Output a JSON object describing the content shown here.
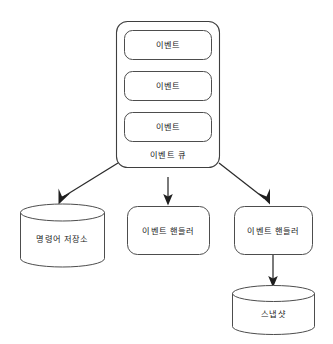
{
  "diagram": {
    "background_color": "#ffffff",
    "stroke_color": "#4d4d4d",
    "arrow_color": "#1f1f1f",
    "text_color": "#1a1a1a",
    "nodes": {
      "event_queue": {
        "label": "이벤트 큐",
        "shape": "rounded-rect",
        "items": [
          {
            "label": "이벤트",
            "shape": "rounded-rect"
          },
          {
            "label": "이벤트",
            "shape": "rounded-rect"
          },
          {
            "label": "이벤트",
            "shape": "rounded-rect"
          }
        ]
      },
      "command_store": {
        "label": "명령어 저장소",
        "shape": "cylinder"
      },
      "event_handler_center": {
        "label": "이벤트 핸들러",
        "shape": "rounded-rect"
      },
      "event_handler_right": {
        "label": "이벤트 핸들러",
        "shape": "rounded-rect"
      },
      "snapshot": {
        "label": "스냅샷",
        "shape": "cylinder"
      }
    },
    "edges": [
      {
        "from": "event_queue",
        "to": "command_store",
        "style": "solid-arrow"
      },
      {
        "from": "event_queue",
        "to": "event_handler_center",
        "style": "solid-arrow"
      },
      {
        "from": "event_queue",
        "to": "event_handler_right",
        "style": "solid-arrow"
      },
      {
        "from": "event_handler_right",
        "to": "snapshot",
        "style": "solid-arrow"
      }
    ]
  }
}
